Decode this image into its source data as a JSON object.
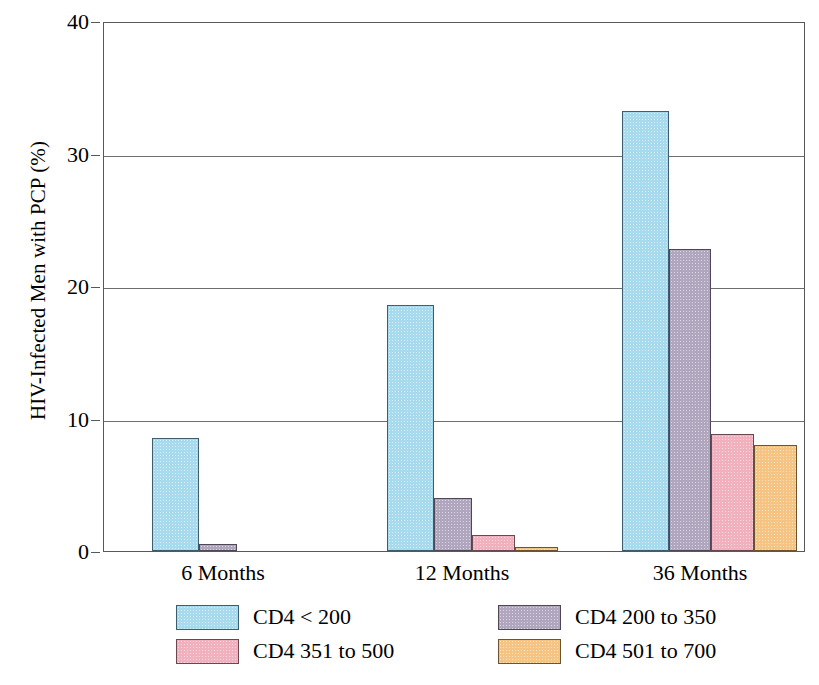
{
  "chart_data": {
    "type": "bar",
    "title": "",
    "xlabel": "",
    "ylabel": "HIV-Infected Men with PCP (%)",
    "categories": [
      "6 Months",
      "12 Months",
      "36 Months"
    ],
    "ylim": [
      0,
      40
    ],
    "yticks": [
      0,
      10,
      20,
      30,
      40
    ],
    "ytick_labels": [
      "0",
      "10",
      "20",
      "30",
      "40"
    ],
    "grid": "horizontal",
    "legend_position": "below-axis",
    "series": [
      {
        "name": "CD4 < 200",
        "color": "#a8daee",
        "values": [
          8.5,
          18.6,
          33.2
        ]
      },
      {
        "name": "CD4 200 to 350",
        "color": "#b0a6be",
        "values": [
          0.5,
          4.0,
          22.8
        ]
      },
      {
        "name": "CD4 351 to 500",
        "color": "#f0b0bd",
        "values": [
          0,
          1.2,
          8.8
        ]
      },
      {
        "name": "CD4 501 to 700",
        "color": "#f5c483",
        "values": [
          0,
          0.3,
          8.0
        ]
      }
    ]
  },
  "axis": {
    "y_title": "HIV-Infected Men with PCP (%)",
    "y_tick_0": "0",
    "y_tick_1": "10",
    "y_tick_2": "20",
    "y_tick_3": "30",
    "y_tick_4": "40",
    "x_cat_0": "6 Months",
    "x_cat_1": "12 Months",
    "x_cat_2": "36 Months"
  },
  "legend": {
    "entries": [
      {
        "label": "CD4 < 200",
        "color": "#a8daee"
      },
      {
        "label": "CD4 200 to 350",
        "color": "#b0a6be"
      },
      {
        "label": "CD4 351 to 500",
        "color": "#f0b0bd"
      },
      {
        "label": "CD4 501 to 700",
        "color": "#f5c483"
      }
    ]
  }
}
